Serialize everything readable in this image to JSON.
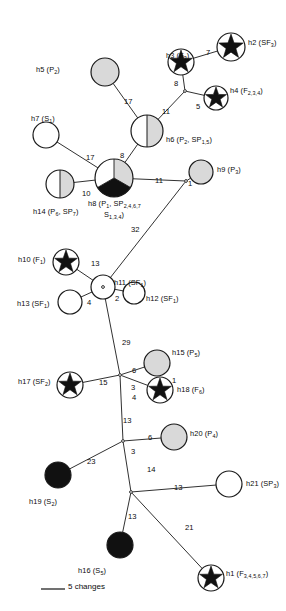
{
  "figure": {
    "type": "haplotype-network",
    "legend": {
      "label": "5 changes",
      "scale_changes": 5
    }
  },
  "chart_data": {
    "type": "network",
    "title": "",
    "legend_entries": [
      "5 changes"
    ],
    "node_fills": {
      "white": "#ffffff",
      "gray": "#d9d9d9",
      "black": "#111111",
      "outline": "#1a1a1a"
    },
    "nodes": [
      {
        "id": "h1",
        "label": "h1 (F",
        "sub": "3,4,5,6,7",
        "tail": ")",
        "cx": 211,
        "cy": 578,
        "r": 13,
        "style": "star",
        "label_x": 226,
        "label_y": 570,
        "anchor": "start"
      },
      {
        "id": "h2",
        "label": "h2 (SF",
        "sub": "3",
        "tail": ")",
        "cx": 231,
        "cy": 47,
        "r": 14,
        "style": "star",
        "label_x": 248,
        "label_y": 39,
        "anchor": "start"
      },
      {
        "id": "h3",
        "label": "h3 (F",
        "sub": "3",
        "tail": ")",
        "cx": 181,
        "cy": 62,
        "r": 13,
        "style": "star",
        "label_x": 166,
        "label_y": 52,
        "anchor": "end"
      },
      {
        "id": "h4",
        "label": "h4 (F",
        "sub": "2,3,4",
        "tail": ")",
        "cx": 216,
        "cy": 98,
        "r": 12,
        "style": "star",
        "label_x": 230,
        "label_y": 87,
        "anchor": "start"
      },
      {
        "id": "h5",
        "label": "h5 (P",
        "sub": "2",
        "tail": ")",
        "cx": 105,
        "cy": 72,
        "r": 14,
        "style": "gray",
        "label_x": 36,
        "label_y": 66,
        "anchor": "start"
      },
      {
        "id": "h6",
        "label": "h6 (P",
        "sub": "2",
        "tail": ", SP",
        "sub2": "1,5",
        "tail2": ")",
        "cx": 147,
        "cy": 131,
        "r": 16,
        "style": "half-white-gray",
        "label_x": 166,
        "label_y": 136,
        "anchor": "start"
      },
      {
        "id": "h7",
        "label": "h7 (S",
        "sub": "1",
        "tail": ")",
        "cx": 46,
        "cy": 135,
        "r": 13,
        "style": "white",
        "label_x": 31,
        "label_y": 115,
        "anchor": "start"
      },
      {
        "id": "h8",
        "label": "h8 (P",
        "sub": "1",
        "tail": ", SP",
        "sub2": "2,4,6,7",
        "tail2": "",
        "cx": 114,
        "cy": 178,
        "r": 19,
        "style": "pie3",
        "label_x": 88,
        "label_y": 200,
        "anchor": "start"
      },
      {
        "id": "h8b",
        "label": "S",
        "sub": "1,3,4",
        "tail": ")",
        "cx": 0,
        "cy": 0,
        "r": 0,
        "style": "none",
        "label_x": 104,
        "label_y": 211,
        "anchor": "start"
      },
      {
        "id": "h9",
        "label": "h9 (P",
        "sub": "3",
        "tail": ")",
        "cx": 201,
        "cy": 172,
        "r": 12,
        "style": "gray",
        "label_x": 217,
        "label_y": 166,
        "anchor": "start"
      },
      {
        "id": "h10",
        "label": "h10 (F",
        "sub": "1",
        "tail": ")",
        "cx": 66,
        "cy": 262,
        "r": 13,
        "style": "star",
        "label_x": 18,
        "label_y": 256,
        "anchor": "start"
      },
      {
        "id": "h11",
        "label": "h11 (SF",
        "sub": "1",
        "tail": ")",
        "cx": 103,
        "cy": 287,
        "r": 12,
        "style": "white",
        "label_x": 114,
        "label_y": 279,
        "anchor": "start"
      },
      {
        "id": "h12",
        "label": "h12 (SF",
        "sub": "1",
        "tail": ")",
        "cx": 134,
        "cy": 293,
        "r": 11,
        "style": "white",
        "label_x": 146,
        "label_y": 295,
        "anchor": "start"
      },
      {
        "id": "h13",
        "label": "h13 (SF",
        "sub": "1",
        "tail": ")",
        "cx": 70,
        "cy": 302,
        "r": 12,
        "style": "white",
        "label_x": 17,
        "label_y": 300,
        "anchor": "start"
      },
      {
        "id": "h14",
        "label": "h14 (P",
        "sub": "6",
        "tail": ", SP",
        "sub2": "7",
        "tail2": ")",
        "cx": 60,
        "cy": 184,
        "r": 14,
        "style": "half-white-gray",
        "label_x": 33,
        "label_y": 208,
        "anchor": "start"
      },
      {
        "id": "h15",
        "label": "h15 (P",
        "sub": "5",
        "tail": ")",
        "cx": 157,
        "cy": 363,
        "r": 13,
        "style": "gray",
        "label_x": 172,
        "label_y": 349,
        "anchor": "start"
      },
      {
        "id": "h16",
        "label": "h16 (S",
        "sub": "5",
        "tail": ")",
        "cx": 120,
        "cy": 545,
        "r": 13,
        "style": "black",
        "label_x": 78,
        "label_y": 567,
        "anchor": "start"
      },
      {
        "id": "h17",
        "label": "h17 (SF",
        "sub": "2",
        "tail": ")",
        "cx": 70,
        "cy": 385,
        "r": 13,
        "style": "star",
        "label_x": 18,
        "label_y": 378,
        "anchor": "start"
      },
      {
        "id": "h18",
        "label": "h18 (F",
        "sub": "6",
        "tail": ")",
        "cx": 160,
        "cy": 390,
        "r": 13,
        "style": "star",
        "label_x": 177,
        "label_y": 386,
        "anchor": "start"
      },
      {
        "id": "h19",
        "label": "h19 (S",
        "sub": "2",
        "tail": ")",
        "cx": 58,
        "cy": 475,
        "r": 13,
        "style": "black",
        "label_x": 29,
        "label_y": 498,
        "anchor": "start"
      },
      {
        "id": "h20",
        "label": "h20 (P",
        "sub": "4",
        "tail": ")",
        "cx": 174,
        "cy": 437,
        "r": 13,
        "style": "gray",
        "label_x": 190,
        "label_y": 430,
        "anchor": "start"
      },
      {
        "id": "h21",
        "label": "h21 (SP",
        "sub": "3",
        "tail": ")",
        "cx": 229,
        "cy": 484,
        "r": 13,
        "style": "white",
        "label_x": 246,
        "label_y": 480,
        "anchor": "start"
      }
    ],
    "junctions": [
      {
        "id": "j_h3h4",
        "x": 185,
        "y": 91
      },
      {
        "id": "j_h9",
        "x": 186,
        "y": 181
      },
      {
        "id": "j_h11",
        "x": 103,
        "y": 287
      },
      {
        "id": "j_mid",
        "x": 120,
        "y": 375
      },
      {
        "id": "j_low",
        "x": 123,
        "y": 441
      },
      {
        "id": "j_bot",
        "x": 131,
        "y": 492
      }
    ],
    "edges": [
      {
        "from": "h3",
        "to": "h2",
        "value": 7,
        "num_x": 206,
        "num_y": 49
      },
      {
        "from": "h3",
        "to": "j_h3h4",
        "value": 8,
        "num_x": 174,
        "num_y": 80
      },
      {
        "from": "j_h3h4",
        "to": "h4",
        "value": 5,
        "num_x": 196,
        "num_y": 103
      },
      {
        "from": "j_h3h4",
        "to": "h6",
        "value": 11,
        "num_x": 162,
        "num_y": 108
      },
      {
        "from": "h5",
        "to": "h6",
        "value": 17,
        "num_x": 124,
        "num_y": 98
      },
      {
        "from": "h6",
        "to": "h8",
        "value": 8,
        "num_x": 120,
        "num_y": 152
      },
      {
        "from": "h7",
        "to": "h8",
        "value": 17,
        "num_x": 86,
        "num_y": 154
      },
      {
        "from": "h14",
        "to": "h8",
        "value": 10,
        "num_x": 82,
        "num_y": 190
      },
      {
        "from": "h8",
        "to": "j_h9",
        "value": 11,
        "num_x": 155,
        "num_y": 177
      },
      {
        "from": "j_h9",
        "to": "h9",
        "value": 1,
        "num_x": 188,
        "num_y": 180
      },
      {
        "from": "j_h9",
        "to": "j_h11",
        "value": 32,
        "num_x": 131,
        "num_y": 226
      },
      {
        "from": "h10",
        "to": "j_h11",
        "value": 13,
        "num_x": 91,
        "num_y": 260
      },
      {
        "from": "j_h11",
        "to": "h12",
        "value": 2,
        "num_x": 115,
        "num_y": 295
      },
      {
        "from": "h13",
        "to": "j_h11",
        "value": 4,
        "num_x": 87,
        "num_y": 299
      },
      {
        "from": "j_h11",
        "to": "j_mid",
        "value": 29,
        "num_x": 122,
        "num_y": 339
      },
      {
        "from": "j_mid",
        "to": "h15",
        "value": 6,
        "num_x": 132,
        "num_y": 367
      },
      {
        "from": "h17",
        "to": "j_mid",
        "value": 15,
        "num_x": 99,
        "num_y": 379
      },
      {
        "from": "j_mid",
        "to": "h18",
        "value": 4,
        "num_x": 132,
        "num_y": 394
      },
      {
        "from": "j_mid",
        "to": "j_low",
        "value": 13,
        "num_x": 123,
        "num_y": 417
      },
      {
        "from": "j_low",
        "to": "h20",
        "value": 6,
        "num_x": 148,
        "num_y": 434
      },
      {
        "from": "h19",
        "to": "j_low",
        "value": 23,
        "num_x": 87,
        "num_y": 458
      },
      {
        "from": "j_low",
        "to": "j_bot",
        "value": 14,
        "num_x": 147,
        "num_y": 466
      },
      {
        "from": "j_bot",
        "to": "h21",
        "value": 13,
        "num_x": 174,
        "num_y": 484
      },
      {
        "from": "j_bot",
        "to": "h16",
        "value": 13,
        "num_x": 128,
        "num_y": 513
      },
      {
        "from": "j_bot",
        "to": "h1",
        "value": 21,
        "num_x": 185,
        "num_y": 524
      }
    ],
    "junction_labels": [
      {
        "text": "1",
        "x": 172,
        "y": 377
      },
      {
        "text": "3",
        "x": 131,
        "y": 384
      },
      {
        "text": "3",
        "x": 131,
        "y": 448
      }
    ]
  }
}
